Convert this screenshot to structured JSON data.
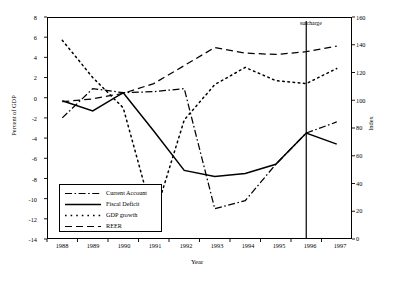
{
  "chart_data": {
    "type": "line",
    "title": "",
    "xlabel": "Year",
    "ylabel": "Percent of GDP",
    "y2label": "Index",
    "x": [
      1988,
      1989,
      1990,
      1991,
      1992,
      1993,
      1994,
      1995,
      1996,
      1997
    ],
    "xticklabels": [
      "1988",
      "1989",
      "1990",
      "1991",
      "1992",
      "1993",
      "1994",
      "1995",
      "1996",
      "1997"
    ],
    "yticklabels": [
      "8",
      "6",
      "4",
      "2",
      "0",
      "-2",
      "-4",
      "-6",
      "-8",
      "-10",
      "-12",
      "-14"
    ],
    "y2ticklabels": [
      "160",
      "140",
      "120",
      "100",
      "80",
      "60",
      "40",
      "20",
      "0"
    ],
    "ylim": [
      -14,
      8
    ],
    "y2lim": [
      0,
      160
    ],
    "xlim": [
      1987.5,
      1997.5
    ],
    "grid": false,
    "legend_position": "lower-left",
    "annotations": [
      {
        "text": "surcharge",
        "x": 1996,
        "type": "vertical-line"
      }
    ],
    "series": [
      {
        "name": "Current Account",
        "axis": "left",
        "style": "dash-dot",
        "values": [
          -2.0,
          0.9,
          0.5,
          0.6,
          0.9,
          -11.0,
          -10.2,
          -6.6,
          -3.5,
          -2.4
        ]
      },
      {
        "name": "Fiscal Deficit",
        "axis": "left",
        "style": "solid",
        "values": [
          -0.3,
          -1.3,
          0.5,
          -3.3,
          -7.2,
          -7.8,
          -7.5,
          -6.6,
          -3.5,
          -4.6
        ]
      },
      {
        "name": "GDP growth",
        "axis": "left",
        "style": "dotted",
        "values": [
          5.7,
          2.0,
          -1.0,
          -12.0,
          -2.2,
          1.3,
          3.0,
          1.7,
          1.4,
          2.9
        ]
      },
      {
        "name": "REER",
        "axis": "right",
        "style": "dashed",
        "values": [
          99,
          101,
          105,
          112,
          125,
          138,
          134,
          133,
          135,
          139
        ]
      }
    ]
  }
}
